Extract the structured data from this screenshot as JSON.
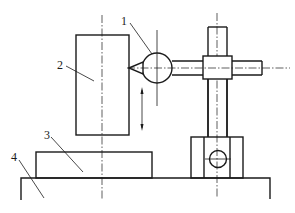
{
  "diagram": {
    "title": "",
    "labels": [
      {
        "id": "1",
        "text": "1",
        "x": 121,
        "y": 25
      },
      {
        "id": "2",
        "text": "2",
        "x": 57,
        "y": 68
      },
      {
        "id": "3",
        "text": "3",
        "x": 44,
        "y": 139
      },
      {
        "id": "4",
        "text": "4",
        "x": 11,
        "y": 161
      }
    ],
    "parts": {
      "1": "spherical probe / gauge head",
      "2": "workpiece (measured block)",
      "3": "reference block",
      "4": "base plate"
    },
    "colors": {
      "line": "#1a1a1a",
      "background": "#ffffff"
    }
  }
}
